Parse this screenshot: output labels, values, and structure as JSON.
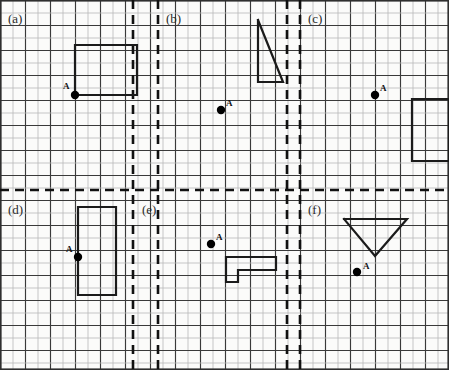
{
  "worksheet": {
    "title": "Transformation grid worksheet",
    "width": 449,
    "height": 370,
    "grid": {
      "cell": 12.5,
      "origin_x": 0.5,
      "origin_y": 0.5,
      "cols": 36,
      "rows": 30,
      "minor_color": "#b9b9b9",
      "major_color": "#3a3a3a",
      "major_every": 2,
      "border_color": "#2f2f2f"
    },
    "dividers": {
      "color": "#111111",
      "dash": "9 6",
      "width": 2.6,
      "vertical_x": [
        133,
        158,
        287,
        300
      ],
      "horizontal_y": [
        190
      ]
    },
    "shape_color": "#1b1b1b",
    "shape_width": 2.2,
    "point_color": "#000000",
    "point_radius": 4.2
  },
  "panels": [
    {
      "id": "a",
      "label": "(a)",
      "label_x": 8,
      "label_y": 12,
      "point": {
        "name": "A",
        "x": 75,
        "y": 95,
        "label_x": 63,
        "label_y": 82
      },
      "shape": {
        "type": "rectangle",
        "points": "75,95 75,45 137,45 137,95 75,95"
      }
    },
    {
      "id": "b",
      "label": "(b)",
      "label_x": 166,
      "label_y": 12,
      "point": {
        "name": "A",
        "x": 221,
        "y": 110,
        "label_x": 226,
        "label_y": 99
      },
      "shape": {
        "type": "triangle",
        "points": "258,20 258,82 283,82 258,20"
      }
    },
    {
      "id": "c",
      "label": "(c)",
      "label_x": 308,
      "label_y": 12,
      "point": {
        "name": "A",
        "x": 375,
        "y": 95,
        "label_x": 380,
        "label_y": 84
      },
      "shape": {
        "type": "rectangle",
        "points": "412,99 449,99 449,161 412,161 412,99"
      }
    },
    {
      "id": "d",
      "label": "(d)",
      "label_x": 8,
      "label_y": 203,
      "point": {
        "name": "A",
        "x": 78,
        "y": 257,
        "label_x": 66,
        "label_y": 245
      },
      "shape": {
        "type": "rectangle",
        "points": "78,207 116,207 116,295 78,295 78,207"
      }
    },
    {
      "id": "e",
      "label": "(e)",
      "label_x": 142,
      "label_y": 203,
      "point": {
        "name": "A",
        "x": 211,
        "y": 244,
        "label_x": 216,
        "label_y": 233
      },
      "shape": {
        "type": "l-shape",
        "points": "226,257 276,257 276,270 238,270 238,282 226,282 226,257"
      }
    },
    {
      "id": "f",
      "label": "(f)",
      "label_x": 308,
      "label_y": 203,
      "point": {
        "name": "A",
        "x": 357,
        "y": 272,
        "label_x": 363,
        "label_y": 262
      },
      "shape": {
        "type": "triangle",
        "points": "344,219 407,219 375,256 344,219"
      }
    }
  ]
}
